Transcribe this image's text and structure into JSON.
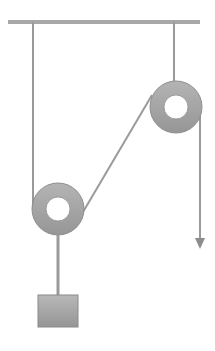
{
  "diagram": {
    "type": "pulley-system",
    "colors": {
      "background": "#ffffff",
      "rope": "#9a9a9a",
      "ceiling": "#a8a8a8",
      "pulley_outer": "#a6a6a6",
      "pulley_inner": "#ffffff",
      "block": "#a0a0a0",
      "arrow": "#8c8c8c"
    },
    "ceiling": {
      "x1": 8,
      "x2": 200,
      "y": 22
    },
    "fixed_pulley": {
      "cx": 176,
      "cy": 107,
      "r": 26,
      "hole_r": 12
    },
    "movable_pulley": {
      "cx": 58,
      "cy": 209,
      "r": 26,
      "hole_r": 12
    },
    "block": {
      "x": 38,
      "y": 295,
      "w": 40,
      "h": 32
    },
    "pull_arrow": {
      "x": 200,
      "y1": 107,
      "y2": 248
    }
  }
}
